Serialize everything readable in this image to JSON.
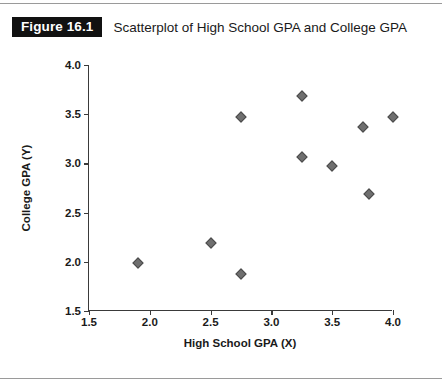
{
  "figure": {
    "badge": "Figure 16.1",
    "title": "Scatterplot of High School GPA and College GPA"
  },
  "chart_data": {
    "type": "scatter",
    "title": "Scatterplot of High School GPA and College GPA",
    "xlabel": "High School GPA (X)",
    "ylabel": "College GPA (Y)",
    "xlim": [
      1.5,
      4.0
    ],
    "ylim": [
      1.5,
      4.0
    ],
    "xticks": [
      "1.5",
      "2.0",
      "2.5",
      "3.0",
      "3.5",
      "4.0"
    ],
    "yticks": [
      "1.5",
      "2.0",
      "2.5",
      "3.0",
      "3.5",
      "4.0"
    ],
    "xtick_values": [
      1.5,
      2.0,
      2.5,
      3.0,
      3.5,
      4.0
    ],
    "ytick_values": [
      1.5,
      2.0,
      2.5,
      3.0,
      3.5,
      4.0
    ],
    "grid": false,
    "legend": false,
    "marker": "diamond",
    "marker_color": "#6f6f6f",
    "marker_edge_color": "#4a4a4a",
    "points": [
      {
        "x": 1.9,
        "y": 1.99
      },
      {
        "x": 2.5,
        "y": 2.19
      },
      {
        "x": 2.75,
        "y": 1.88
      },
      {
        "x": 2.75,
        "y": 3.47
      },
      {
        "x": 3.25,
        "y": 3.68
      },
      {
        "x": 3.25,
        "y": 3.07
      },
      {
        "x": 3.5,
        "y": 2.97
      },
      {
        "x": 3.75,
        "y": 3.37
      },
      {
        "x": 3.8,
        "y": 2.69
      },
      {
        "x": 4.0,
        "y": 3.47
      }
    ]
  }
}
